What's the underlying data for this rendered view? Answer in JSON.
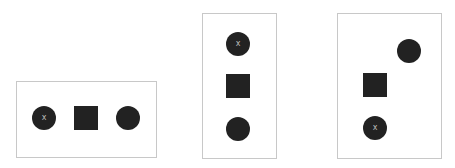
{
  "colors": {
    "shape": "#222222",
    "border": "#c8c8c8",
    "mark": "#bdbdbd",
    "background": "#ffffff"
  },
  "panels": [
    {
      "name": "panel-horizontal",
      "box": {
        "left": 16,
        "top": 81,
        "width": 141,
        "height": 77
      },
      "shapes": [
        {
          "type": "circle",
          "left": 32,
          "top": 106,
          "mark": "x"
        },
        {
          "type": "square",
          "left": 74,
          "top": 106,
          "mark": ""
        },
        {
          "type": "circle",
          "left": 116,
          "top": 106,
          "mark": ""
        }
      ]
    },
    {
      "name": "panel-vertical",
      "box": {
        "left": 202,
        "top": 13,
        "width": 75,
        "height": 146
      },
      "shapes": [
        {
          "type": "circle",
          "left": 226,
          "top": 32,
          "mark": "x"
        },
        {
          "type": "square",
          "left": 226,
          "top": 74,
          "mark": ""
        },
        {
          "type": "circle",
          "left": 226,
          "top": 117,
          "mark": ""
        }
      ]
    },
    {
      "name": "panel-diagonal",
      "box": {
        "left": 337,
        "top": 13,
        "width": 105,
        "height": 146
      },
      "shapes": [
        {
          "type": "circle",
          "left": 397,
          "top": 39,
          "mark": ""
        },
        {
          "type": "square",
          "left": 363,
          "top": 73,
          "mark": ""
        },
        {
          "type": "circle",
          "left": 363,
          "top": 116,
          "mark": "x"
        }
      ]
    }
  ]
}
